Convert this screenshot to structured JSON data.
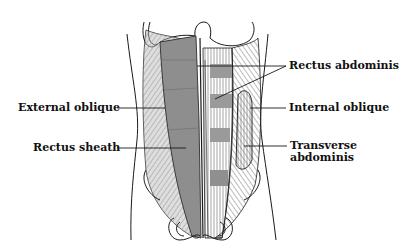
{
  "diagram": {
    "colors": {
      "outline": "#1a1a1a",
      "muscle_fill": "#8e8e8e",
      "muscle_light": "#bdbdbd",
      "rectus_sheath_fill": "#7d7d7d",
      "background": "#ffffff"
    },
    "labels": [
      {
        "id": "external-oblique",
        "text": "External oblique",
        "side": "left"
      },
      {
        "id": "rectus-sheath",
        "text": "Rectus sheath",
        "side": "left"
      },
      {
        "id": "rectus-abdominis",
        "text": "Rectus abdominis",
        "side": "right"
      },
      {
        "id": "internal-oblique",
        "text": "Internal oblique",
        "side": "right"
      },
      {
        "id": "transverse-abdominis-line1",
        "text": "Transverse",
        "side": "right"
      },
      {
        "id": "transverse-abdominis-line2",
        "text": "abdominis",
        "side": "right"
      }
    ]
  }
}
